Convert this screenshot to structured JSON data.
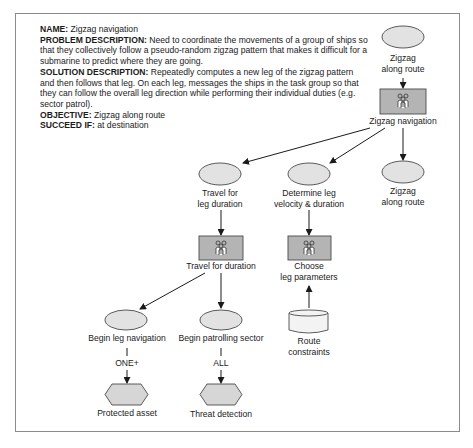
{
  "description": {
    "name_label": "NAME:",
    "name": "Zigzag navigation",
    "problem_label": "PROBLEM DESCRIPTION:",
    "problem": "Need to coordinate the movements of a group of ships so that they collectively follow a pseudo-random zigzag pattern that makes it difficult for a submarine to predict where they are going.",
    "solution_label": "SOLUTION DESCRIPTION:",
    "solution": "Repeatedly computes a new leg of the zigzag pattern and then follows that leg. On each leg, messages the ships in the task group so that they can follow the overall leg direction while performing their individual duties (e.g. sector patrol).",
    "objective_label": "OBJECTIVE:",
    "objective": "Zigzag along route",
    "succeed_label": "SUCCEED IF:",
    "succeed": "at destination"
  },
  "nodes": {
    "top_goal": {
      "line1": "Zigzag",
      "line2": "along route"
    },
    "zigzag_nav": {
      "label": "Zigzag navigation"
    },
    "travel_leg": {
      "line1": "Travel for",
      "line2": "leg duration"
    },
    "determine_leg": {
      "line1": "Determine leg",
      "line2": "velocity & duration"
    },
    "zigzag_route2": {
      "line1": "Zigzag",
      "line2": "along route"
    },
    "travel_duration": {
      "label": "Travel for duration"
    },
    "choose_params": {
      "line1": "Choose",
      "line2": "leg parameters"
    },
    "route_constraints": {
      "line1": "Route",
      "line2": "constraints"
    },
    "begin_leg_nav": {
      "label": "Begin leg navigation"
    },
    "begin_patrol": {
      "label": "Begin patrolling sector"
    },
    "protected_asset": {
      "label": "Protected asset"
    },
    "threat_detection": {
      "label": "Threat detection"
    }
  },
  "edge_labels": {
    "one_plus": "ONE+",
    "all": "ALL"
  },
  "colors": {
    "ellipse_fill": "#e2e2e2",
    "rect_fill": "#b4b4b4",
    "hex_fill": "#d6d6d6",
    "stroke": "#4a4a4a"
  }
}
